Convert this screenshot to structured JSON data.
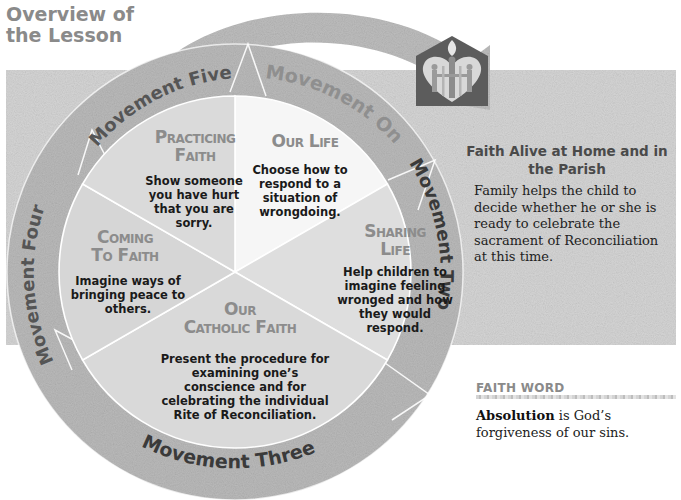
{
  "header": {
    "title_line1": "Overview of",
    "title_line2": "the Lesson"
  },
  "diagram": {
    "ring_labels": [
      {
        "id": "movement-one",
        "label": "Movement One"
      },
      {
        "id": "movement-two",
        "label": "Movement Two"
      },
      {
        "id": "movement-three",
        "label": "Movement Three"
      },
      {
        "id": "movement-four",
        "label": "Movement Four"
      },
      {
        "id": "movement-five",
        "label": "Movement Five"
      }
    ],
    "segments": [
      {
        "id": "our-life",
        "title_line1": "Our Life",
        "title_line2": "",
        "body": "Choose how to respond to a situation of wrongdoing."
      },
      {
        "id": "sharing-life",
        "title_line1": "Sharing",
        "title_line2": "Life",
        "body": "Help children to imagine feeling wronged and how they would respond."
      },
      {
        "id": "our-catholic-faith",
        "title_line1": "Our",
        "title_line2": "Catholic Faith",
        "body": "Present the procedure for examining one’s conscience and for celebrating the individual Rite of Reconciliation."
      },
      {
        "id": "coming-to-faith",
        "title_line1": "Coming",
        "title_line2": "To Faith",
        "body": "Imagine ways of bringing peace to others."
      },
      {
        "id": "practicing-faith",
        "title_line1": "Practicing",
        "title_line2": "Faith",
        "body": "Show someone you have hurt that you are sorry."
      }
    ],
    "icon": "heart-family-flame-icon"
  },
  "faith_alive": {
    "title": "Faith Alive at Home and in the Parish",
    "body": "Family helps the child to decide whether he or she is ready to celebrate the sacrament of Reconciliation at this time."
  },
  "faith_word": {
    "heading": "FAITH WORD",
    "term": "Absolution",
    "definition": " is God’s forgiveness of our sins."
  },
  "colors": {
    "background_band": "#d6d6d6",
    "ring": "#bcbcbc",
    "pie_light": "#f4f4f4",
    "pie_mid": "#dcdcdc",
    "title_gray": "#8a8a8a",
    "icon_dark": "#5a5a5a"
  }
}
